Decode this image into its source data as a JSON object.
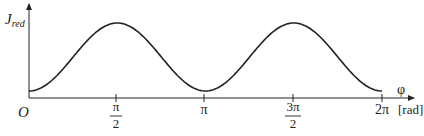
{
  "chart_data": {
    "type": "line",
    "title": "",
    "xlabel": "φ",
    "xlabel_unit": "[rad]",
    "ylabel": "J",
    "ylabel_subscript": "red",
    "origin_label": "O",
    "x_ticks": [
      {
        "value": 1.5708,
        "num": "π",
        "den": "2"
      },
      {
        "value": 3.1416,
        "label": "π"
      },
      {
        "value": 4.7124,
        "num": "3π",
        "den": "2"
      },
      {
        "value": 6.2832,
        "label": "2π"
      }
    ],
    "xlim": [
      0,
      6.2832
    ],
    "ylim": [
      0,
      1.1
    ],
    "grid": false,
    "legend": null,
    "series": [
      {
        "name": "J_red",
        "x": [
          0,
          0.3927,
          0.7854,
          1.1781,
          1.5708,
          1.9635,
          2.3562,
          2.7489,
          3.1416,
          3.5343,
          3.927,
          4.3197,
          4.7124,
          5.1051,
          5.4978,
          5.8905,
          6.2832
        ],
        "y": [
          0.1,
          0.23,
          0.55,
          0.87,
          1.0,
          0.87,
          0.55,
          0.23,
          0.1,
          0.23,
          0.55,
          0.87,
          1.0,
          0.87,
          0.55,
          0.23,
          0.1
        ]
      }
    ]
  }
}
